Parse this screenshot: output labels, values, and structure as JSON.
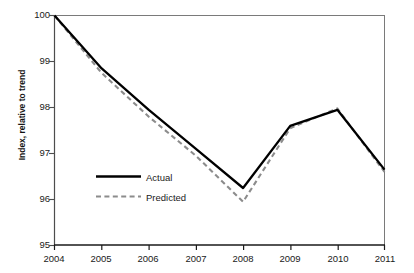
{
  "chart_data": {
    "type": "line",
    "title": "",
    "xlabel": "",
    "ylabel": "Index, relative to trend",
    "x": [
      2004,
      2005,
      2006,
      2007,
      2008,
      2009,
      2010,
      2011
    ],
    "xtick_labels": [
      "2004",
      "2005",
      "2006",
      "2007",
      "2008",
      "2009",
      "2010",
      "2011"
    ],
    "ytick_labels": [
      "95",
      "96",
      "97",
      "98",
      "99",
      "100"
    ],
    "yticks": [
      95,
      96,
      97,
      98,
      99,
      100
    ],
    "ylim": [
      95,
      100
    ],
    "xlim": [
      2004,
      2011
    ],
    "grid": false,
    "legend_position": "center-left",
    "series": [
      {
        "name": "Actual",
        "style": "solid",
        "color": "#000000",
        "values": [
          100.0,
          98.85,
          97.95,
          97.1,
          96.25,
          97.6,
          97.95,
          96.65
        ]
      },
      {
        "name": "Predicted",
        "style": "dashed",
        "color": "#8c8c8c",
        "values": [
          100.0,
          98.75,
          97.8,
          96.95,
          95.95,
          97.55,
          97.98,
          96.6
        ]
      }
    ]
  },
  "axes": {
    "y_axis_title": "Index, relative to trend",
    "y_tick_0": "95",
    "y_tick_1": "96",
    "y_tick_2": "97",
    "y_tick_3": "98",
    "y_tick_4": "99",
    "y_tick_5": "100",
    "x_tick_0": "2004",
    "x_tick_1": "2005",
    "x_tick_2": "2006",
    "x_tick_3": "2007",
    "x_tick_4": "2008",
    "x_tick_5": "2009",
    "x_tick_6": "2010",
    "x_tick_7": "2011"
  },
  "legend": {
    "entry_actual": "Actual",
    "entry_predicted": "Predicted"
  },
  "colors": {
    "actual_line": "#000000",
    "predicted_line": "#8c8c8c",
    "axis": "#4d4d4d",
    "text": "#1a1a1a",
    "background": "#ffffff"
  }
}
